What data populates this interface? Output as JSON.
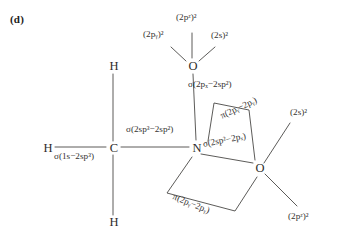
{
  "figure": {
    "panel_tag": "(d)",
    "caption_present": false
  },
  "atoms": [
    {
      "id": "h-top",
      "symbol": "H",
      "x": 113,
      "y": 66
    },
    {
      "id": "h-left",
      "symbol": "H",
      "x": 47,
      "y": 148
    },
    {
      "id": "h-bottom",
      "symbol": "H",
      "x": 113,
      "y": 222
    },
    {
      "id": "carbon",
      "symbol": "C",
      "x": 113,
      "y": 148
    },
    {
      "id": "nitrogen",
      "symbol": "N",
      "x": 196,
      "y": 148
    },
    {
      "id": "oxygen-top",
      "symbol": "O",
      "x": 192,
      "y": 66
    },
    {
      "id": "oxygen-right",
      "symbol": "O",
      "x": 259,
      "y": 168
    }
  ],
  "bond_labels": {
    "c_h_left": "σ(1s−2sp³)",
    "c_n": "σ(2sp³−2sp²)",
    "o_top_n": "σ(2pₓ−2sp²)",
    "n_o_right_sigma": "σ(2sp²−2pₓ)",
    "n_o_right_pi_upper": "π(2pᵧ−2pᵧ)",
    "n_o_right_pi_lower": "π(2pᵧ−2pᵧ)"
  },
  "lone_pairs": {
    "oxygen_top": [
      {
        "id": "o-top-2py",
        "label": "(2pᵧ)²"
      },
      {
        "id": "o-top-2pz",
        "label": "(2pᶻ)²"
      },
      {
        "id": "o-top-2s",
        "label": "(2s)²"
      }
    ],
    "oxygen_right": [
      {
        "id": "o-right-2s",
        "label": "(2s)²"
      },
      {
        "id": "o-right-2pz",
        "label": "(2pᶻ)²"
      }
    ]
  },
  "style": {
    "line_color": "#4a4846",
    "text_color": "#33312f",
    "background": "#ffffff"
  }
}
